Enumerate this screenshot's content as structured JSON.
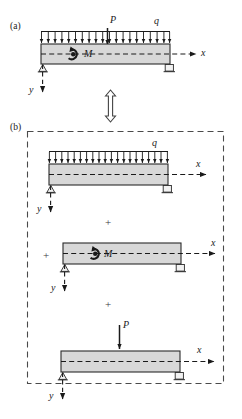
{
  "figure": {
    "title_a": "(a)",
    "title_b": "(b)",
    "beam_fill": "#d8d8d8",
    "beam_stroke": "#2a2a2a",
    "line_color": "#1a1a1a",
    "equivalence_symbol": "double-headed-vertical-arrow"
  },
  "panel_a": {
    "label": "(a)",
    "loads": {
      "distributed_label": "q",
      "point_label": "P",
      "moment_label": "M"
    },
    "axes": {
      "x_label": "x",
      "y_label": "y"
    },
    "supports": {
      "left": "pin-support",
      "right": "roller-support"
    },
    "distributed_arrow_count": 20
  },
  "panel_b": {
    "label": "(b)",
    "operators": [
      "+",
      "+"
    ],
    "cases": [
      {
        "name": "distributed-load-case",
        "load_label": "q",
        "x_label": "x",
        "y_label": "y",
        "distributed_arrow_count": 20,
        "supports": {
          "left": "pin-support",
          "right": "roller-support"
        }
      },
      {
        "name": "moment-load-case",
        "load_label": "M",
        "x_label": "x",
        "y_label": "y",
        "supports": {
          "left": "pin-support",
          "right": "roller-support"
        }
      },
      {
        "name": "point-load-case",
        "load_label": "P",
        "x_label": "x",
        "y_label": "y",
        "supports": {
          "left": "pin-support",
          "right": "roller-support"
        }
      }
    ]
  }
}
